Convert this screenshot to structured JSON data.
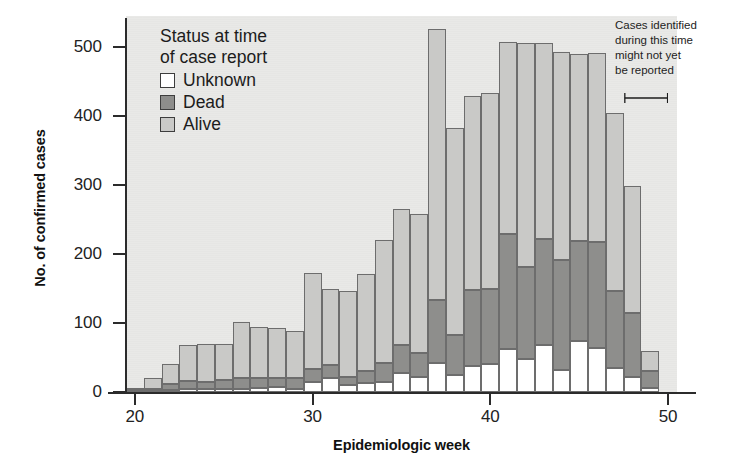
{
  "figure": {
    "cropped_title": "",
    "background": "#e9e9e7"
  },
  "axes": {
    "y": {
      "label": "No. of confirmed cases",
      "ticks": [
        0,
        100,
        200,
        300,
        400,
        500
      ],
      "min": 0,
      "max": 545
    },
    "x": {
      "label": "Epidemiologic week",
      "ticks": [
        20,
        30,
        40,
        50
      ],
      "min": 19.5,
      "max": 50.5
    }
  },
  "legend": {
    "title_line1": "Status at time",
    "title_line2": "of case report",
    "items": [
      {
        "label": "Unknown",
        "color": "#ffffff"
      },
      {
        "label": "Dead",
        "color": "#8e8e8c"
      },
      {
        "label": "Alive",
        "color": "#c9c9c7"
      }
    ]
  },
  "annotation": {
    "lines": [
      "Cases identified",
      "during this time",
      "might not yet",
      "be reported"
    ],
    "bracket_from_week": 47.5,
    "bracket_to_week": 50
  },
  "chart_data": {
    "type": "bar",
    "stacked": true,
    "title": "",
    "xlabel": "Epidemiologic week",
    "ylabel": "No. of confirmed cases",
    "xlim": [
      19.5,
      50.5
    ],
    "ylim": [
      0,
      545
    ],
    "grid": false,
    "legend_position": "top-left-inside",
    "categories": [
      20,
      21,
      22,
      23,
      24,
      25,
      26,
      27,
      28,
      29,
      30,
      31,
      32,
      33,
      34,
      35,
      36,
      37,
      38,
      39,
      40,
      41,
      42,
      43,
      44,
      45,
      46,
      47,
      48,
      49
    ],
    "series": [
      {
        "name": "Unknown",
        "color": "#ffffff",
        "values": [
          1,
          2,
          3,
          4,
          5,
          5,
          5,
          6,
          7,
          5,
          14,
          20,
          10,
          13,
          15,
          28,
          22,
          42,
          25,
          38,
          40,
          63,
          48,
          68,
          32,
          74,
          64,
          35,
          22,
          6
        ]
      },
      {
        "name": "Dead",
        "color": "#8e8e8c",
        "values": [
          2,
          3,
          9,
          12,
          10,
          13,
          16,
          14,
          13,
          15,
          20,
          19,
          12,
          17,
          27,
          40,
          34,
          91,
          58,
          110,
          110,
          166,
          133,
          154,
          159,
          145,
          154,
          112,
          93,
          25
        ]
      },
      {
        "name": "Alive",
        "color": "#c9c9c7",
        "values": [
          3,
          15,
          29,
          52,
          54,
          52,
          80,
          74,
          73,
          68,
          139,
          110,
          124,
          141,
          178,
          197,
          202,
          393,
          299,
          281,
          283,
          278,
          325,
          284,
          302,
          271,
          274,
          257,
          184,
          29
        ]
      }
    ]
  }
}
